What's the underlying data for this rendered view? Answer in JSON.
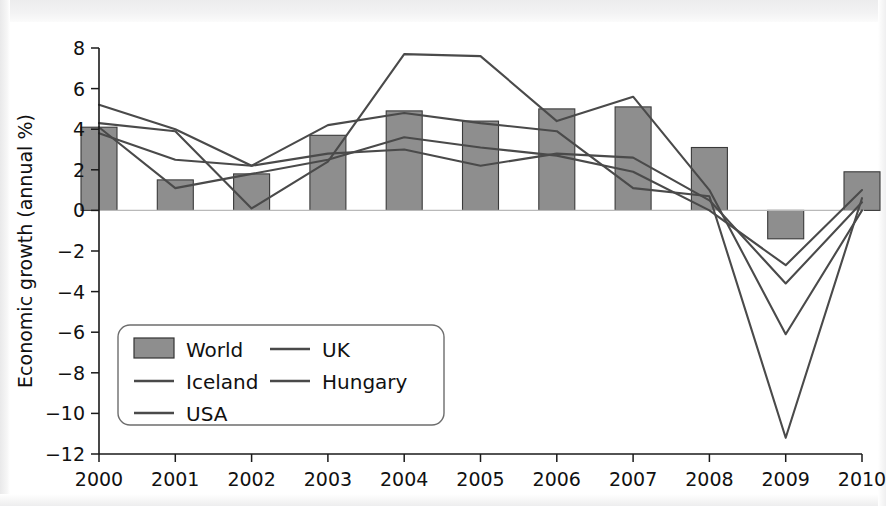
{
  "figure": {
    "background_color": "#ffffff",
    "ink_color": "#1a1a1a",
    "bar_fill_color": "#8e8e8e",
    "bar_edge_color": "#3a3a3a",
    "line_color": "#4a4a4a"
  },
  "chart_data": {
    "type": "bar",
    "title": "",
    "subtitle": "",
    "xlabel": "",
    "ylabel": "Economic growth (annual %)",
    "categories": [
      "2000",
      "2001",
      "2002",
      "2003",
      "2004",
      "2005",
      "2006",
      "2007",
      "2008",
      "2009",
      "2010"
    ],
    "x": [
      2000,
      2001,
      2002,
      2003,
      2004,
      2005,
      2006,
      2007,
      2008,
      2009,
      2010
    ],
    "xlim": [
      2000,
      2010
    ],
    "ylim": [
      -12,
      8
    ],
    "ytick_labels": [
      "8",
      "6",
      "4",
      "2",
      "0",
      "−2",
      "−4",
      "−6",
      "−8",
      "−10",
      "−12"
    ],
    "yticks": [
      8,
      6,
      4,
      2,
      0,
      -2,
      -4,
      -6,
      -8,
      -10,
      -12
    ],
    "xtick_labels": [
      "2000",
      "2001",
      "2002",
      "2003",
      "2004",
      "2005",
      "2006",
      "2007",
      "2008",
      "2009",
      "2010"
    ],
    "grid": false,
    "zero_line": true,
    "legend_position": "lower-left-inside",
    "bar_series": {
      "name": "World",
      "kind": "bar",
      "values": [
        4.1,
        1.5,
        1.8,
        3.7,
        4.9,
        4.4,
        5.0,
        5.1,
        3.1,
        -1.4,
        1.9
      ]
    },
    "series": [
      {
        "name": "World",
        "kind": "bar",
        "values": [
          4.1,
          1.5,
          1.8,
          3.7,
          4.9,
          4.4,
          5.0,
          5.1,
          3.1,
          -1.4,
          1.9
        ]
      },
      {
        "name": "Iceland",
        "kind": "line",
        "values": [
          4.3,
          3.9,
          0.1,
          2.4,
          7.7,
          7.6,
          4.4,
          5.6,
          1.0,
          -6.1,
          0.0
        ]
      },
      {
        "name": "USA",
        "kind": "line",
        "values": [
          4.1,
          1.1,
          1.8,
          2.5,
          3.6,
          3.1,
          2.7,
          1.9,
          0.0,
          -2.7,
          1.0
        ]
      },
      {
        "name": "UK",
        "kind": "line",
        "values": [
          5.2,
          4.0,
          2.2,
          2.8,
          3.0,
          2.2,
          2.8,
          2.6,
          0.5,
          -3.6,
          0.4
        ]
      },
      {
        "name": "Hungary",
        "kind": "line",
        "values": [
          3.8,
          2.5,
          2.2,
          4.2,
          4.8,
          4.3,
          3.9,
          1.1,
          0.7,
          -11.2,
          0.6
        ]
      }
    ],
    "legend_entries": [
      {
        "label": "World",
        "marker": "bar"
      },
      {
        "label": "UK",
        "marker": "line"
      },
      {
        "label": "Iceland",
        "marker": "line"
      },
      {
        "label": "Hungary",
        "marker": "line"
      },
      {
        "label": "USA",
        "marker": "line"
      }
    ]
  }
}
